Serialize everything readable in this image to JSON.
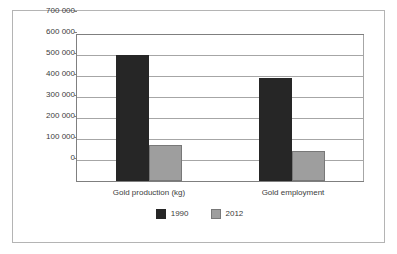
{
  "chart_data": {
    "type": "bar",
    "title": "",
    "subtitle": "",
    "xlabel": "",
    "ylabel": "",
    "categories": [
      "Gold production (kg)",
      "Gold employment"
    ],
    "series": [
      {
        "name": "1990",
        "color": "#262626",
        "values": [
          600000,
          490000
        ]
      },
      {
        "name": "2012",
        "color": "#9e9e9e",
        "values": [
          171000,
          143000
        ]
      }
    ],
    "ylim": [
      0,
      700000
    ],
    "ytick_values": [
      700000,
      600000,
      500000,
      400000,
      300000,
      200000,
      100000,
      0
    ],
    "ytick_labels": [
      "700 000",
      "600 000",
      "500 000",
      "400 000",
      "300 000",
      "200 000",
      "100 000",
      "0"
    ],
    "grid": true,
    "legend_position": "bottom",
    "annotations": []
  },
  "legend": {
    "items": [
      {
        "label": "1990",
        "swatch": "dark-square-swatch"
      },
      {
        "label": "2012",
        "swatch": "gray-square-swatch"
      }
    ]
  },
  "colors": {
    "series_1990": "#262626",
    "series_2012": "#9e9e9e",
    "gridline": "#a6a6a6",
    "axis": "#808080",
    "frame_border": "#b4b4b4",
    "text": "#3c3c3c",
    "background": "#ffffff"
  }
}
